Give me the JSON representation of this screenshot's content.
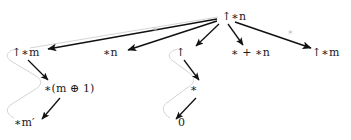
{
  "figure": {
    "type": "tree-diagram",
    "background": "#ffffff",
    "arrow_color": "#111111",
    "brace_color": "#cccccc",
    "edge_label_color": "#bdbdbd"
  },
  "nodes": [
    {
      "id": "root",
      "label": "↑∗n",
      "plain": "up*n",
      "x": 222,
      "y": 16
    },
    {
      "id": "up-star-m",
      "label": "↑∗m",
      "plain": "up*m",
      "x": 12,
      "y": 52
    },
    {
      "id": "star-n",
      "label": "∗n",
      "plain": "*n",
      "x": 103,
      "y": 52
    },
    {
      "id": "up",
      "label": "↑",
      "plain": "up",
      "x": 176,
      "y": 52
    },
    {
      "id": "sum",
      "label": "∗ + ∗n",
      "plain": "* + *n",
      "x": 231,
      "y": 52
    },
    {
      "id": "up-star-m2",
      "label": "↑∗m",
      "plain": "up*m",
      "x": 312,
      "y": 52
    },
    {
      "id": "star-paren",
      "label": "∗(m ⊕ 1)",
      "plain": "*(m xor 1)",
      "x": 44,
      "y": 88
    },
    {
      "id": "star",
      "label": "∗",
      "plain": "*",
      "x": 190,
      "y": 88
    },
    {
      "id": "star-mp",
      "label": "∗m′",
      "plain": "*m'",
      "x": 14,
      "y": 122
    },
    {
      "id": "zero",
      "label": "0",
      "plain": "0",
      "x": 178,
      "y": 122
    }
  ],
  "edge_labels": [
    {
      "id": "edge-label-left",
      "label": "∗",
      "x": 152,
      "y": 28
    },
    {
      "id": "edge-label-right",
      "label": "∗",
      "x": 287,
      "y": 31
    }
  ],
  "edges": [
    {
      "from": "root",
      "to": "up-star-m",
      "style": "arrow"
    },
    {
      "from": "root",
      "to": "star-n",
      "style": "arrow"
    },
    {
      "from": "root",
      "to": "up",
      "style": "arrow"
    },
    {
      "from": "root",
      "to": "sum",
      "style": "arrow"
    },
    {
      "from": "root",
      "to": "up-star-m2",
      "style": "arrow"
    },
    {
      "from": "up-star-m",
      "to": "star-paren",
      "style": "arrow"
    },
    {
      "from": "star-paren",
      "to": "star-mp",
      "style": "arrow"
    },
    {
      "from": "up",
      "to": "star",
      "style": "arrow"
    },
    {
      "from": "star",
      "to": "zero",
      "style": "arrow"
    }
  ],
  "braces": [
    {
      "id": "brace-left",
      "description": "faint zigzag brace spanning left branch"
    },
    {
      "id": "brace-middle",
      "description": "faint zigzag brace spanning middle branch"
    },
    {
      "id": "brace-top",
      "description": "faint line from root to left node"
    }
  ]
}
